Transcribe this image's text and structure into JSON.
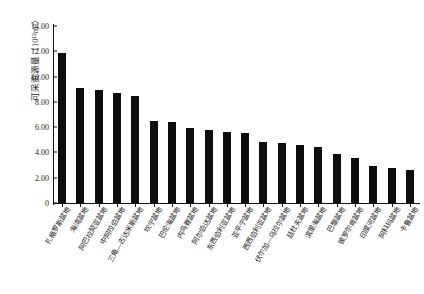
{
  "chart_data": {
    "type": "bar",
    "title": "",
    "xlabel": "",
    "ylabel": "可采资源量（10¹²m³）",
    "ylim": [
      0,
      14
    ],
    "ytick_labels": [
      "14.00",
      "12.00",
      "10.00",
      "8.00",
      "6.00",
      "4.00",
      "2.00",
      "0"
    ],
    "ytick_values": [
      14,
      12,
      10,
      8,
      6,
      4,
      2,
      0
    ],
    "grid": false,
    "legend": null,
    "bar_color": "#0d0d0d",
    "categories": [
      "扎格罗斯盆地",
      "海湾盆地",
      "阿巴拉契亚盆地",
      "中阿拉伯盆地",
      "三角—古达米斯盆地",
      "坎宁盆地",
      "巴伦海盆地",
      "内鸟脊盆地",
      "阿尔伯达盆地",
      "东西伯利亚盆地",
      "亚平宁盆地",
      "西西伯利亚盆地",
      "伏尔加—乌拉尔盆地",
      "廷杜夫盆地",
      "滨里海盆地",
      "巴黎盆地",
      "彼罗尔肯盆地",
      "印度河盆地",
      "阿科玛盆地",
      "卡鲁盆地"
    ],
    "values": [
      11.9,
      9.1,
      8.95,
      8.7,
      8.5,
      6.5,
      6.4,
      5.95,
      5.8,
      5.6,
      5.5,
      4.85,
      4.75,
      4.55,
      4.4,
      3.85,
      3.6,
      2.95,
      2.8,
      2.65
    ],
    "values_unit": "10^12 m^3"
  }
}
